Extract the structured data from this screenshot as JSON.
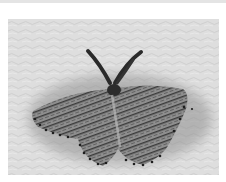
{
  "image": {
    "subject": "moth",
    "description": "Grayscale photograph of a speckled moth with spread wings and feathery antennae resting on a textured light surface",
    "colors": {
      "background": "#ffffff",
      "top_band": "#e4e4e4",
      "surface": "#dcdcdc",
      "shadow": "#9a9a9a",
      "wing": "#8c8c8c",
      "markings": "#2a2a2a"
    }
  }
}
